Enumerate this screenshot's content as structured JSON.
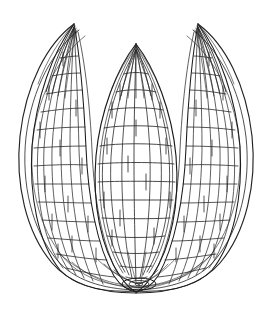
{
  "figure": {
    "title": "Gored sphere wireframe sketch",
    "style": "pen-and-ink line drawing, no fill, white background",
    "canvas": {
      "width": 272,
      "height": 315
    },
    "colors": {
      "background": "#ffffff",
      "ink": "#1a1a1a",
      "ink_light": "#2b2b2b"
    },
    "geometry": {
      "center_x": 136,
      "center_y": 168,
      "radius_x": 118,
      "radius_y": 130,
      "top_y": 20,
      "bottom_y": 292,
      "left_x": 18,
      "right_x": 254,
      "gore_count_visible": 3,
      "gore_gap_count": 2,
      "parallels_per_gore": 13,
      "meridians_per_gore": 7,
      "pole_ring_rx": 17,
      "pole_ring_ry": 6,
      "pole_ring_cx": 139,
      "pole_ring_cy": 284
    },
    "gores": [
      {
        "name": "left-gore",
        "center_x": 62,
        "half_width": 38,
        "tip_x": 74,
        "tip_y": 22
      },
      {
        "name": "center-gore",
        "center_x": 136,
        "half_width": 44,
        "tip_x": 136,
        "tip_y": 44
      },
      {
        "name": "right-gore",
        "center_x": 210,
        "half_width": 38,
        "tip_x": 198,
        "tip_y": 22
      }
    ],
    "labels": {
      "none_visible": true
    }
  }
}
